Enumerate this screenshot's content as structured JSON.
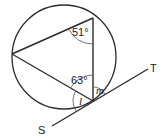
{
  "diagram": {
    "type": "circle-geometry",
    "circle": {
      "cx": 64,
      "cy": 57,
      "r": 52
    },
    "points": {
      "top": {
        "x": 93,
        "y": 18
      },
      "left": {
        "x": 12,
        "y": 54
      },
      "bottom": {
        "x": 93,
        "y": 101
      }
    },
    "tangent": {
      "start": {
        "x": 52,
        "y": 126
      },
      "end": {
        "x": 148,
        "y": 69
      },
      "label_start": "S",
      "label_end": "T"
    },
    "angles": {
      "top_angle": "51°",
      "left_angle_at_bottom": "63°",
      "angle_l": "l",
      "angle_m": "m"
    },
    "colors": {
      "line": "#2b2b2b",
      "background": "#ffffff"
    }
  }
}
